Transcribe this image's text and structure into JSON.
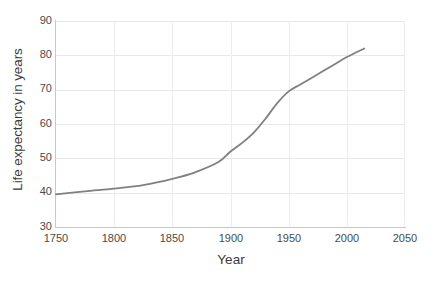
{
  "chart_data": {
    "type": "line",
    "title": "",
    "xlabel": "Year",
    "ylabel": "Life expectancy in years",
    "xlim": [
      1750,
      2050
    ],
    "ylim": [
      30,
      90
    ],
    "xticks": [
      1750,
      1800,
      1850,
      1900,
      1950,
      2000,
      2050
    ],
    "yticks": [
      30,
      40,
      50,
      60,
      70,
      80,
      90
    ],
    "grid": true,
    "legend": "none",
    "series": [
      {
        "name": "Life expectancy",
        "color": "#808080",
        "x": [
          1750,
          1775,
          1800,
          1825,
          1850,
          1870,
          1890,
          1900,
          1910,
          1920,
          1930,
          1940,
          1950,
          1960,
          1970,
          1980,
          1990,
          2000,
          2015
        ],
        "values": [
          39.5,
          40.4,
          41.2,
          42.2,
          44.0,
          46.0,
          49.0,
          52.0,
          54.5,
          57.5,
          61.5,
          66.0,
          69.5,
          71.5,
          73.5,
          75.5,
          77.5,
          79.5,
          82.0
        ]
      }
    ]
  },
  "axes": {
    "x_title": "Year",
    "y_title": "Life expectancy in years",
    "x_tick_labels": [
      "1750",
      "1800",
      "1850",
      "1900",
      "1950",
      "2000",
      "2050"
    ],
    "y_tick_labels": [
      "90",
      "80",
      "70",
      "60",
      "50",
      "40",
      "30"
    ]
  },
  "colors": {
    "line": "#808080",
    "gridline": "#e8e8e8",
    "axis": "#c9c9c9",
    "text": "#4a4a4a",
    "title_text": "#3b3b3b",
    "background": "#ffffff"
  }
}
